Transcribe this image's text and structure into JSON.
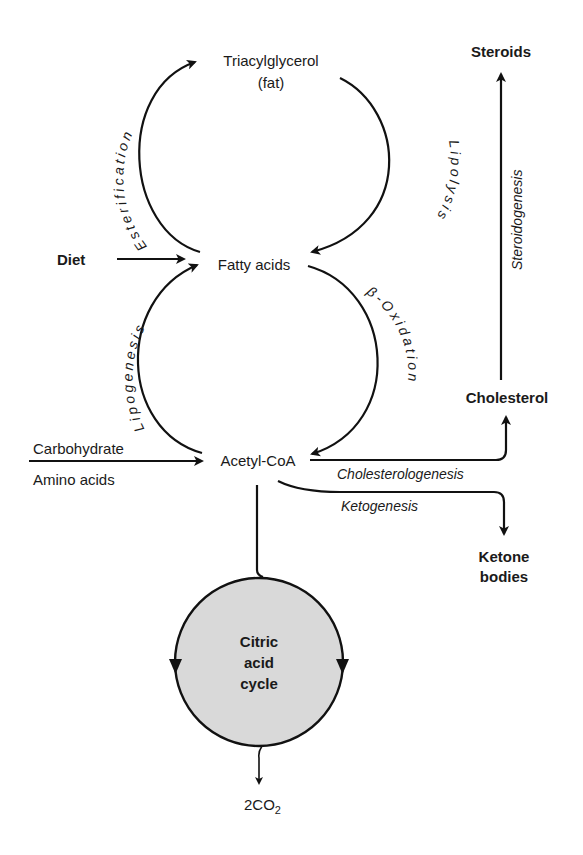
{
  "diagram": {
    "nodes": {
      "triacylglycerol": "Triacylglycerol",
      "triacylglycerol_sub": "(fat)",
      "fatty_acids": "Fatty acids",
      "acetyl_coa": "Acetyl-CoA",
      "diet": "Diet",
      "carbohydrate": "Carbohydrate",
      "amino_acids": "Amino acids",
      "steroids": "Steroids",
      "cholesterol": "Cholesterol",
      "ketone_1": "Ketone",
      "ketone_2": "bodies",
      "citric_1": "Citric",
      "citric_2": "acid",
      "citric_3": "cycle",
      "co2_prefix": "2CO",
      "co2_sub": "2"
    },
    "processes": {
      "esterification": "Esterification",
      "lipolysis": "Lipolysis",
      "lipogenesis": "Lipogenesis",
      "beta_oxidation": "β-Oxidation",
      "steroidogenesis": "Steroidogenesis",
      "cholesterologenesis": "Cholesterologenesis",
      "ketogenesis": "Ketogenesis"
    },
    "colors": {
      "circle_fill": "#d9d9d9",
      "stroke": "#111111"
    }
  }
}
